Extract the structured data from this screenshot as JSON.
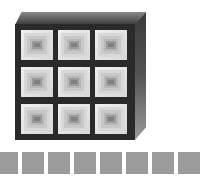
{
  "figure": {
    "box": {
      "rows": 3,
      "cols": 3,
      "front_color": "#2a2a2a",
      "top_color": "#6a6a6a",
      "side_color": "#555555"
    },
    "cells": [
      {
        "row": 0,
        "col": 0
      },
      {
        "row": 0,
        "col": 1
      },
      {
        "row": 0,
        "col": 2
      },
      {
        "row": 1,
        "col": 0
      },
      {
        "row": 1,
        "col": 1
      },
      {
        "row": 1,
        "col": 2
      },
      {
        "row": 2,
        "col": 0
      },
      {
        "row": 2,
        "col": 1
      },
      {
        "row": 2,
        "col": 2
      }
    ],
    "cell_colors": {
      "outer": "#d8d8d8",
      "mid": "#b8b8b8",
      "inner": "#9a9a9a",
      "core": "#808080"
    },
    "bottom_row": {
      "count": 8,
      "color": "#9b9b9b"
    }
  }
}
